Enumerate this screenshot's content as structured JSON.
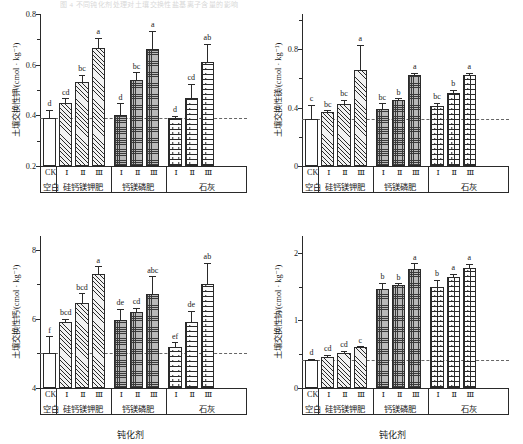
{
  "figure": {
    "top_caption": "图 4  不同钝化剂处理对土壤交换性盐基离子含量的影响",
    "xaxis_title": "钝化剂",
    "unit_label": "/(cmol · kg",
    "unit_exponent": "-1",
    "unit_close": ")",
    "groups": [
      {
        "name": "空白",
        "pattern": "solid",
        "levels": [
          "CK"
        ]
      },
      {
        "name": "硅钙镁钾肥",
        "pattern": "diag",
        "levels": [
          "Ⅰ",
          "Ⅱ",
          "Ⅲ"
        ]
      },
      {
        "name": "钙镁磷肥",
        "pattern": "check",
        "levels": [
          "Ⅰ",
          "Ⅱ",
          "Ⅲ"
        ]
      },
      {
        "name": "石灰",
        "pattern": "brick",
        "levels": [
          "Ⅰ",
          "Ⅱ",
          "Ⅲ"
        ]
      }
    ]
  },
  "chart_data": [
    {
      "id": "panel-exchangeable-k",
      "type": "bar",
      "title": "",
      "ylabel": "土壤交换性钾/(cmol · kg⁻¹)",
      "xlabel": "",
      "ylim": [
        0.2,
        0.8
      ],
      "yticks": [
        0.2,
        0.4,
        0.6,
        0.8
      ],
      "ytick_labels": [
        "0.2",
        "0.4",
        "0.6",
        "0.8"
      ],
      "yminor": [
        0.3,
        0.5,
        0.7
      ],
      "grid": false,
      "reference_line": 0.39,
      "categories": [
        "CK",
        "Ⅰ",
        "Ⅱ",
        "Ⅲ",
        "Ⅰ",
        "Ⅱ",
        "Ⅲ",
        "Ⅰ",
        "Ⅱ",
        "Ⅲ"
      ],
      "group_of": [
        "空白",
        "硅钙镁钾肥",
        "硅钙镁钾肥",
        "硅钙镁钾肥",
        "钙镁磷肥",
        "钙镁磷肥",
        "钙镁磷肥",
        "石灰",
        "石灰",
        "石灰"
      ],
      "patterns": [
        "solid",
        "diag",
        "diag",
        "diag",
        "check",
        "check",
        "check",
        "brick",
        "brick",
        "brick"
      ],
      "values": [
        0.39,
        0.45,
        0.53,
        0.665,
        0.4,
        0.54,
        0.66,
        0.39,
        0.47,
        0.61
      ],
      "errors": [
        0.032,
        0.018,
        0.03,
        0.042,
        0.047,
        0.03,
        0.073,
        0.009,
        0.055,
        0.072
      ],
      "sig_letters": [
        "d",
        "cd",
        "bc",
        "a",
        "d",
        "bc",
        "a",
        "d",
        "cd",
        "ab"
      ]
    },
    {
      "id": "panel-exchangeable-mg",
      "type": "bar",
      "title": "",
      "ylabel": "土壤交换性镁/(cmol · kg⁻¹)",
      "xlabel": "",
      "ylim": [
        0,
        1.04
      ],
      "yticks": [
        0,
        0.4,
        0.8
      ],
      "ytick_labels": [
        "0",
        "0.4",
        "0.8"
      ],
      "yminor": [
        0.2,
        0.6,
        1.0
      ],
      "grid": false,
      "reference_line": 0.32,
      "categories": [
        "CK",
        "Ⅰ",
        "Ⅱ",
        "Ⅲ",
        "Ⅰ",
        "Ⅱ",
        "Ⅲ",
        "Ⅰ",
        "Ⅱ",
        "Ⅲ"
      ],
      "group_of": [
        "空白",
        "硅钙镁钾肥",
        "硅钙镁钾肥",
        "硅钙镁钾肥",
        "钙镁磷肥",
        "钙镁磷肥",
        "钙镁磷肥",
        "石灰",
        "石灰",
        "石灰"
      ],
      "patterns": [
        "solid",
        "diag",
        "diag",
        "diag",
        "check",
        "check",
        "check",
        "brick",
        "brick",
        "brick"
      ],
      "values": [
        0.32,
        0.37,
        0.425,
        0.655,
        0.39,
        0.45,
        0.62,
        0.41,
        0.5,
        0.625
      ],
      "errors": [
        0.1,
        0.012,
        0.028,
        0.175,
        0.04,
        0.012,
        0.018,
        0.022,
        0.022,
        0.012
      ],
      "sig_letters": [
        "c",
        "bc",
        "bc",
        "a",
        "bc",
        "b",
        "a",
        "bc",
        "b",
        "a"
      ]
    },
    {
      "id": "panel-exchangeable-ca",
      "type": "bar",
      "title": "",
      "ylabel": "土壤交换性钙/(cmol · kg⁻¹)",
      "xlabel": "钝化剂",
      "ylim": [
        4,
        8.4
      ],
      "yticks": [
        4,
        6,
        8
      ],
      "ytick_labels": [
        "4",
        "6",
        "8"
      ],
      "yminor": [
        5,
        7
      ],
      "grid": false,
      "reference_line": 5.0,
      "categories": [
        "CK",
        "Ⅰ",
        "Ⅱ",
        "Ⅲ",
        "Ⅰ",
        "Ⅱ",
        "Ⅲ",
        "Ⅰ",
        "Ⅱ",
        "Ⅲ"
      ],
      "group_of": [
        "空白",
        "硅钙镁钾肥",
        "硅钙镁钾肥",
        "硅钙镁钾肥",
        "钙镁磷肥",
        "钙镁磷肥",
        "钙镁磷肥",
        "石灰",
        "石灰",
        "石灰"
      ],
      "patterns": [
        "solid",
        "diag",
        "diag",
        "diag",
        "check",
        "check",
        "check",
        "brick",
        "brick",
        "brick"
      ],
      "values": [
        5.0,
        5.9,
        6.45,
        7.3,
        5.97,
        6.2,
        6.72,
        5.2,
        5.9,
        7.0
      ],
      "errors": [
        0.5,
        0.1,
        0.3,
        0.23,
        0.33,
        0.13,
        0.52,
        0.13,
        0.33,
        0.62
      ],
      "sig_letters": [
        "f",
        "bcd",
        "bcd",
        "a",
        "de",
        "cd",
        "abc",
        "ef",
        "de",
        "ab"
      ]
    },
    {
      "id": "panel-exchangeable-na",
      "type": "bar",
      "title": "",
      "ylabel": "土壤交换性钠/(cmol · kg⁻¹)",
      "xlabel": "钝化剂",
      "ylim": [
        0,
        2.25
      ],
      "yticks": [
        0,
        1,
        2
      ],
      "ytick_labels": [
        "0",
        "1",
        "2"
      ],
      "yminor": [
        0.5,
        1.5
      ],
      "grid": false,
      "reference_line": 0.42,
      "categories": [
        "CK",
        "Ⅰ",
        "Ⅱ",
        "Ⅲ",
        "Ⅰ",
        "Ⅱ",
        "Ⅲ",
        "Ⅰ",
        "Ⅱ",
        "Ⅲ"
      ],
      "group_of": [
        "空白",
        "硅钙镁钾肥",
        "硅钙镁钾肥",
        "硅钙镁钾肥",
        "钙镁磷肥",
        "钙镁磷肥",
        "钙镁磷肥",
        "石灰",
        "石灰",
        "石灰"
      ],
      "patterns": [
        "solid",
        "diag",
        "diag",
        "diag",
        "check",
        "check",
        "check",
        "brick",
        "brick",
        "brick"
      ],
      "values": [
        0.42,
        0.46,
        0.52,
        0.6,
        1.47,
        1.53,
        1.76,
        1.5,
        1.65,
        1.78
      ],
      "errors": [
        0.01,
        0.03,
        0.03,
        0.02,
        0.09,
        0.02,
        0.09,
        0.1,
        0.04,
        0.06
      ],
      "sig_letters": [
        "d",
        "cd",
        "cd",
        "c",
        "b",
        "b",
        "a",
        "b",
        "a",
        "a"
      ]
    }
  ]
}
